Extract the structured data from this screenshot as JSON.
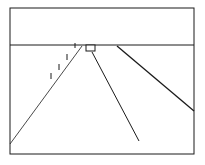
{
  "diagram": {
    "type": "perspective-road-scene",
    "stroke_color": "#1a1a1a",
    "background": "#ffffff",
    "frame": {
      "x": 10,
      "y": 8,
      "width": 184,
      "height": 146
    },
    "horizon_y": 45,
    "road_lines": [
      {
        "name": "left-road-edge",
        "x1": 82,
        "y1": 46,
        "x2": 10,
        "y2": 144
      },
      {
        "name": "center-road-line",
        "x1": 92,
        "y1": 52,
        "x2": 139,
        "y2": 141
      },
      {
        "name": "right-road-edge",
        "x1": 117,
        "y1": 46,
        "x2": 194,
        "y2": 111
      }
    ],
    "vehicle": {
      "x": 86,
      "y": 45,
      "width": 9,
      "height": 6
    },
    "posts": [
      {
        "x": 51,
        "y1": 73,
        "y2": 79
      },
      {
        "x": 59,
        "y1": 64,
        "y2": 70
      },
      {
        "x": 67,
        "y1": 54,
        "y2": 60
      },
      {
        "x": 75,
        "y1": 43,
        "y2": 48
      }
    ]
  }
}
